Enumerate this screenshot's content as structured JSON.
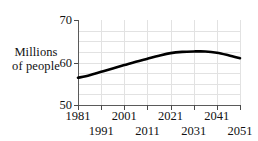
{
  "figure": {
    "background_color": "#ffffff",
    "line_color": "#000000",
    "grid_color": "#e2e2e2",
    "axis_color": "#5a5a5a"
  },
  "axis_title": {
    "line1": "Millions",
    "line2": "of people"
  },
  "chart_data": {
    "type": "line",
    "title": "",
    "xlabel": "",
    "ylabel": "Millions of people",
    "xlim": [
      1981,
      2051
    ],
    "ylim": [
      50,
      70
    ],
    "yticks": [
      50,
      60,
      70
    ],
    "ytick_labels": [
      "50",
      "60",
      "70"
    ],
    "xticks": [
      1981,
      1991,
      2001,
      2011,
      2021,
      2031,
      2041,
      2051
    ],
    "xtick_labels": [
      "1981",
      "1991",
      "2001",
      "2011",
      "2021",
      "2031",
      "2041",
      "2051"
    ],
    "xtick_rows": [
      "top",
      "bottom",
      "top",
      "bottom",
      "top",
      "bottom",
      "top",
      "bottom"
    ],
    "grid": true,
    "grid_axis": "both",
    "legend": false,
    "series": [
      {
        "name": "Population",
        "x": [
          1981,
          1986,
          1991,
          1996,
          2001,
          2006,
          2011,
          2016,
          2021,
          2026,
          2031,
          2036,
          2041,
          2046,
          2051
        ],
        "values": [
          56.4,
          57.0,
          57.8,
          58.6,
          59.4,
          60.2,
          60.9,
          61.6,
          62.2,
          62.5,
          62.6,
          62.6,
          62.3,
          61.7,
          61.0
        ]
      }
    ]
  }
}
